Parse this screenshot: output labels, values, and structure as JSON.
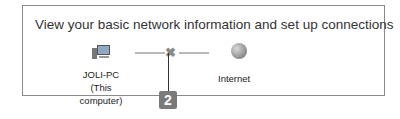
{
  "panel": {
    "title": "View your basic network information and set up connections",
    "computer": {
      "name": "JOLI-PC",
      "subtitle": "(This computer)",
      "icon": "computer-icon"
    },
    "connection": {
      "status_icon": "disconnected-x-icon",
      "glyph": "✖"
    },
    "internet": {
      "label": "Internet",
      "icon": "globe-icon"
    }
  },
  "callout": {
    "number": "2"
  }
}
